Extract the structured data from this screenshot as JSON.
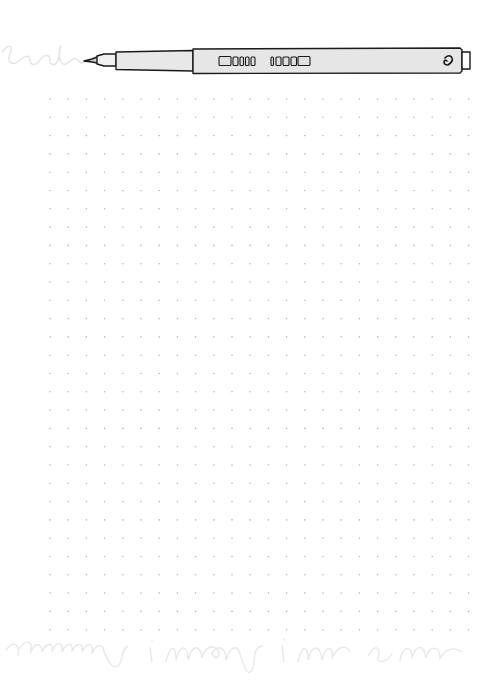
{
  "page": {
    "background": "#ffffff",
    "width": 504,
    "height": 685
  },
  "dot_grid": {
    "start_x": 50,
    "start_y": 99,
    "spacing_x": 18.2,
    "spacing_y": 18.3,
    "columns": 24,
    "rows": 30,
    "dot_color": "#b8b8b8",
    "dot_radius": 0.8
  },
  "pen": {
    "body_color": "#e6e6e6",
    "outline_color": "#1a1a1a",
    "icon": "fineliner-pen-icon",
    "cap_icon": "heart-icon"
  },
  "decorations": {
    "top_scribble": "loop-scribble-icon",
    "bottom_scribble": "cursive-watermark-icon",
    "scribble_color": "#e4e4e4"
  }
}
